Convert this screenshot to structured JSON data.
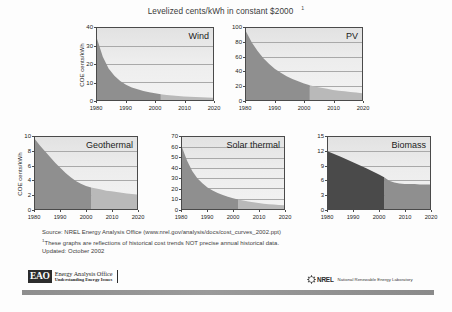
{
  "title": {
    "text": "Levelized cents/kWh in constant $2000",
    "footnote_marker": "1"
  },
  "chart_data": [
    {
      "type": "area",
      "title": "Wind",
      "ylabel": "COE cents/kWh",
      "xlabel": "",
      "ylim": [
        0,
        40
      ],
      "yticks": [
        0,
        10,
        20,
        30,
        40
      ],
      "xlim": [
        1980,
        2020
      ],
      "xticks": [
        1980,
        1990,
        2000,
        2010,
        2020
      ],
      "grid": true,
      "history_end": 2002,
      "series": [
        {
          "name": "Wind levelized COE",
          "x": [
            1980,
            1982,
            1984,
            1986,
            1988,
            1990,
            1992,
            1994,
            1996,
            1998,
            2000,
            2002,
            2004,
            2006,
            2008,
            2010,
            2012,
            2014,
            2016,
            2018,
            2020
          ],
          "values": [
            34,
            24,
            17.5,
            13.5,
            10.5,
            8.5,
            7,
            6,
            5,
            4.3,
            3.7,
            3.2,
            2.8,
            2.5,
            2.2,
            2.0,
            1.8,
            1.6,
            1.5,
            1.4,
            1.3
          ]
        }
      ]
    },
    {
      "type": "area",
      "title": "PV",
      "ylabel": "",
      "xlabel": "",
      "ylim": [
        0,
        100
      ],
      "yticks": [
        0,
        20,
        40,
        60,
        80,
        100
      ],
      "xlim": [
        1980,
        2020
      ],
      "xticks": [
        1980,
        1990,
        2000,
        2010,
        2020
      ],
      "grid": true,
      "history_end": 2002,
      "series": [
        {
          "name": "PV levelized COE",
          "x": [
            1980,
            1982,
            1984,
            1986,
            1988,
            1990,
            1992,
            1994,
            1996,
            1998,
            2000,
            2002,
            2004,
            2006,
            2008,
            2010,
            2012,
            2014,
            2016,
            2018,
            2020
          ],
          "values": [
            95,
            80,
            68,
            58,
            50,
            43,
            38,
            33,
            29,
            26,
            23,
            20.5,
            18.5,
            17,
            15.5,
            14,
            13,
            12,
            11,
            10.3,
            9.5
          ]
        }
      ]
    },
    {
      "type": "area",
      "title": "Geothermal",
      "ylabel": "COE cents/kWh",
      "xlabel": "",
      "ylim": [
        0,
        10
      ],
      "yticks": [
        0,
        2,
        4,
        6,
        8,
        10
      ],
      "xlim": [
        1980,
        2020
      ],
      "xticks": [
        1980,
        1990,
        2000,
        2010,
        2020
      ],
      "grid": true,
      "history_end": 2002,
      "series": [
        {
          "name": "Geothermal levelized COE",
          "x": [
            1980,
            1982,
            1984,
            1986,
            1988,
            1990,
            1992,
            1994,
            1996,
            1998,
            2000,
            2002,
            2004,
            2006,
            2008,
            2010,
            2012,
            2014,
            2016,
            2018,
            2020
          ],
          "values": [
            9.7,
            8.8,
            8.0,
            7.2,
            6.4,
            5.7,
            5.0,
            4.4,
            3.9,
            3.5,
            3.2,
            3.0,
            2.85,
            2.7,
            2.55,
            2.45,
            2.35,
            2.25,
            2.15,
            2.1,
            2.0
          ]
        }
      ]
    },
    {
      "type": "area",
      "title": "Solar thermal",
      "ylabel": "",
      "xlabel": "",
      "ylim": [
        0,
        70
      ],
      "yticks": [
        0,
        10,
        20,
        30,
        40,
        50,
        60,
        70
      ],
      "xlim": [
        1980,
        2020
      ],
      "xticks": [
        1980,
        1990,
        2000,
        2010,
        2020
      ],
      "grid": true,
      "history_end": 2002,
      "series": [
        {
          "name": "Solar thermal levelized COE",
          "x": [
            1980,
            1982,
            1984,
            1986,
            1988,
            1990,
            1992,
            1994,
            1996,
            1998,
            2000,
            2002,
            2004,
            2006,
            2008,
            2010,
            2012,
            2014,
            2016,
            2018,
            2020
          ],
          "values": [
            60,
            47,
            37,
            30,
            25,
            21,
            18,
            15.5,
            13.5,
            12,
            10.5,
            9.3,
            8.2,
            7.3,
            6.5,
            5.8,
            5.2,
            4.7,
            4.3,
            4.0,
            3.7
          ]
        }
      ]
    },
    {
      "type": "area",
      "title": "Biomass",
      "ylabel": "",
      "xlabel": "",
      "ylim": [
        0,
        15
      ],
      "yticks": [
        0,
        3,
        6,
        9,
        12,
        15
      ],
      "xlim": [
        1980,
        2020
      ],
      "xticks": [
        1980,
        1990,
        2000,
        2010,
        2020
      ],
      "grid": true,
      "history_end": 2002,
      "series": [
        {
          "name": "Biomass levelized COE",
          "x": [
            1980,
            1985,
            1990,
            1995,
            2000,
            2002,
            2004,
            2006,
            2008,
            2010,
            2012,
            2014,
            2016,
            2018,
            2020
          ],
          "values": [
            12.0,
            10.9,
            9.7,
            8.5,
            7.2,
            6.6,
            5.9,
            5.5,
            5.3,
            5.2,
            5.2,
            5.2,
            5.1,
            5.1,
            5.1
          ]
        }
      ]
    }
  ],
  "notes": {
    "source": "Source: NREL Energy Analysis Office (www.nrel.gov/analysis/docs/cost_curves_2002.ppt)",
    "footnote_marker": "1",
    "footnote": "These graphs are reflections of historical cost trends NOT precise annual historical data.",
    "updated": "Updated: October 2002"
  },
  "footer": {
    "eao": {
      "badge": "EAO",
      "name": "Energy Analysis Office",
      "tagline": "Understanding Energy Issues"
    },
    "nrel": {
      "name": "NREL",
      "tagline": "National Renewable Energy Laboratory"
    }
  },
  "colors": {
    "history_fill": "#8f8f8f",
    "projection_fill": "#b9b9b9",
    "biomass_history_fill": "#4a4a4a",
    "biomass_projection_fill": "#8f8f8f",
    "plot_bg": "#ededed",
    "axis": "#4a4a4a",
    "grid": "#a9a9a9"
  }
}
